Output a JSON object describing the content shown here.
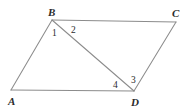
{
  "figure": {
    "background_color": "#ffffff",
    "stroke_color": "#8c8c8c",
    "label_color": "#2b2b2b",
    "width": 192,
    "height": 110,
    "vertices": [
      {
        "name": "A",
        "label": "A",
        "x": 11,
        "y": 90,
        "label_x": 8,
        "label_y": 96
      },
      {
        "name": "B",
        "label": "B",
        "x": 52,
        "y": 20,
        "label_x": 48,
        "label_y": 7
      },
      {
        "name": "C",
        "label": "C",
        "x": 176,
        "y": 22,
        "label_x": 172,
        "label_y": 8
      },
      {
        "name": "D",
        "label": "D",
        "x": 134,
        "y": 91,
        "label_x": 131,
        "label_y": 97
      }
    ],
    "segments": [
      {
        "name": "side-AB",
        "from": "A",
        "to": "B"
      },
      {
        "name": "side-BC",
        "from": "B",
        "to": "C"
      },
      {
        "name": "side-CD",
        "from": "C",
        "to": "D"
      },
      {
        "name": "side-DA",
        "from": "D",
        "to": "A"
      },
      {
        "name": "diagonal-BD",
        "from": "B",
        "to": "D"
      }
    ],
    "angle_labels": [
      {
        "name": "angle-1",
        "label": "1",
        "x": 52,
        "y": 29,
        "at_vertex": "B"
      },
      {
        "name": "angle-2",
        "label": "2",
        "x": 71,
        "y": 26,
        "at_vertex": "B"
      },
      {
        "name": "angle-3",
        "label": "3",
        "x": 131,
        "y": 76,
        "at_vertex": "D"
      },
      {
        "name": "angle-4",
        "label": "4",
        "x": 113,
        "y": 81,
        "at_vertex": "D"
      }
    ]
  }
}
